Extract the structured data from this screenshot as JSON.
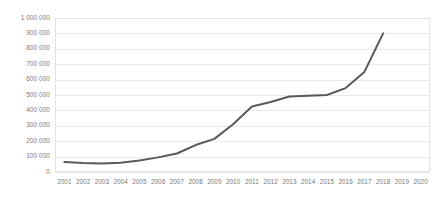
{
  "chart_data": {
    "type": "line",
    "title": "",
    "subtitle": "",
    "xlabel": "",
    "ylabel": "",
    "categories": [
      "2001",
      "2002",
      "2003",
      "2004",
      "2005",
      "2006",
      "2007",
      "2008",
      "2009",
      "2010",
      "2011",
      "2012",
      "2013",
      "2014",
      "2015",
      "2016",
      "2017",
      "2018",
      "2019",
      "2020"
    ],
    "x_tick_labels": [
      "2001",
      "2002",
      "2003",
      "2004",
      "2005",
      "2006",
      "2007",
      "2008",
      "2009",
      "2010",
      "2011",
      "2012",
      "2013",
      "2014",
      "2015",
      "2016",
      "2017",
      "2018",
      "2019",
      "2020"
    ],
    "y_tick_labels": [
      "0",
      "100 000",
      "200 000",
      "300 000",
      "400 000",
      "500 000",
      "600 000",
      "700 000",
      "800 000",
      "900 000",
      "1 000 000"
    ],
    "y_tick_values": [
      0,
      100000,
      200000,
      300000,
      400000,
      500000,
      600000,
      700000,
      800000,
      900000,
      1000000
    ],
    "ylim": [
      0,
      1000000
    ],
    "grid": true,
    "grid_axis": "y",
    "legend": false,
    "legend_position": "none",
    "series": [
      {
        "name": "",
        "color": "#595959",
        "line_width": 2,
        "markers": false,
        "x": [
          "2001",
          "2002",
          "2003",
          "2004",
          "2005",
          "2006",
          "2007",
          "2008",
          "2009",
          "2010",
          "2011",
          "2012",
          "2013",
          "2014",
          "2015",
          "2016",
          "2017",
          "2018"
        ],
        "values": [
          65000,
          58000,
          55000,
          60000,
          75000,
          95000,
          120000,
          175000,
          215000,
          310000,
          425000,
          455000,
          490000,
          495000,
          500000,
          545000,
          650000,
          900000
        ]
      }
    ]
  },
  "axes": {
    "y_axis_name": "y-axis",
    "x_axis_name": "x-axis"
  },
  "colors": {
    "series_line": "#595959",
    "gridline": "#e9e9e9",
    "plot_border": "#e3e3e3",
    "tick_label": "#7a7a7a",
    "background": "#ffffff"
  }
}
